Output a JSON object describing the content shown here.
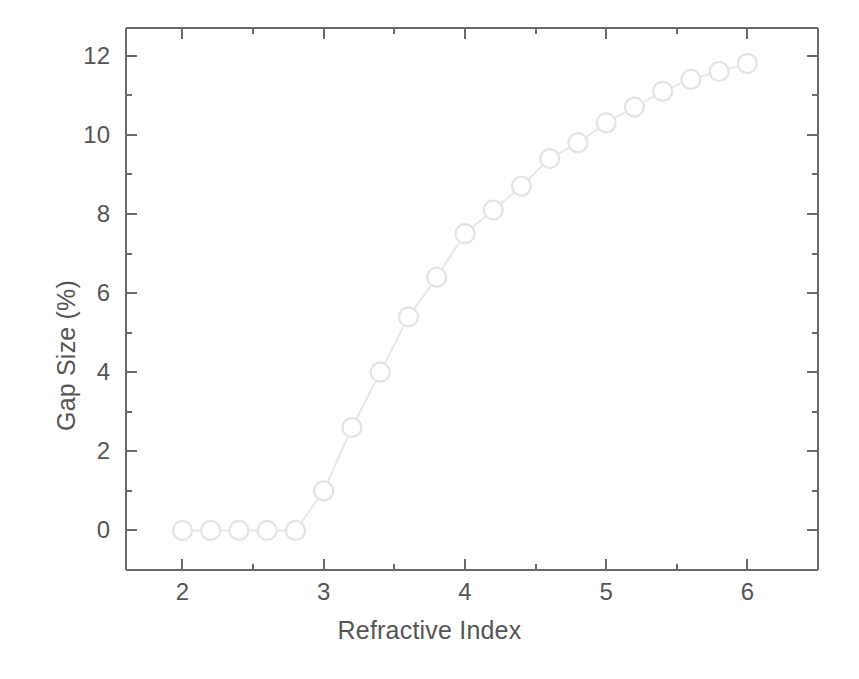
{
  "chart_data": {
    "type": "line",
    "title": "",
    "subtitle": "",
    "xlabel": "Refractive Index",
    "ylabel": "Gap Size (%)",
    "xlim": [
      1.6,
      6.5
    ],
    "ylim": [
      -1.0,
      12.7
    ],
    "xticks": [
      2,
      3,
      4,
      5,
      6
    ],
    "xtick_labels": [
      "2",
      "3",
      "4",
      "5",
      "6"
    ],
    "xminor_ticks": [
      2.5,
      3.5,
      4.5,
      5.5
    ],
    "yticks": [
      0,
      2,
      4,
      6,
      8,
      10,
      12
    ],
    "ytick_labels": [
      "0",
      "2",
      "4",
      "6",
      "8",
      "10",
      "12"
    ],
    "yminor_ticks": [
      1,
      3,
      5,
      7,
      9,
      11
    ],
    "grid": false,
    "legend": null,
    "marker": "open-circle",
    "line_color": "#e8e8e8",
    "marker_color": "#e4e4e4",
    "axis_color": "#6a6a6a",
    "x": [
      2.0,
      2.2,
      2.4,
      2.6,
      2.8,
      3.0,
      3.2,
      3.4,
      3.6,
      3.8,
      4.0,
      4.2,
      4.4,
      4.6,
      4.8,
      5.0,
      5.2,
      5.4,
      5.6,
      5.8,
      6.0
    ],
    "values": [
      0.0,
      0.0,
      0.0,
      0.0,
      0.0,
      1.0,
      2.6,
      4.0,
      5.4,
      6.4,
      7.5,
      8.1,
      8.7,
      9.4,
      9.8,
      10.3,
      10.7,
      11.1,
      11.4,
      11.6,
      11.8
    ],
    "series": [
      {
        "name": "Gap Size",
        "values": [
          0.0,
          0.0,
          0.0,
          0.0,
          0.0,
          1.0,
          2.6,
          4.0,
          5.4,
          6.4,
          7.5,
          8.1,
          8.7,
          9.4,
          9.8,
          10.3,
          10.7,
          11.1,
          11.4,
          11.6,
          11.8
        ]
      }
    ]
  }
}
